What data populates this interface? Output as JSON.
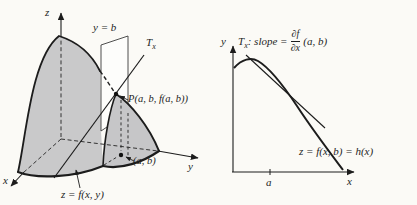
{
  "colors": {
    "background": "#fbfaf6",
    "ink": "#1c1c1c",
    "surface_fill": "#c9c9ca",
    "plane_fill": "#fdfdfb"
  },
  "left_panel": {
    "z_axis_label": "z",
    "x_axis_label": "x",
    "y_axis_label": "y",
    "plane_label": "y = b",
    "tangent_label_base": "T",
    "tangent_label_sub": "x",
    "point_label": "P(a, b, f(a, b))",
    "base_point_label": "(a, b)",
    "surface_label": "z = f(x, y)"
  },
  "right_panel": {
    "y_axis_label": "y",
    "x_axis_label": "x",
    "tick_label": "a",
    "tangent_label_base": "T",
    "tangent_label_sub": "x",
    "tangent_label_rest": ": slope =",
    "fraction_numerator": "∂f",
    "fraction_denominator": "∂x",
    "fraction_args": "(a, b)",
    "curve_label": "z = f(x, b) = h(x)"
  }
}
